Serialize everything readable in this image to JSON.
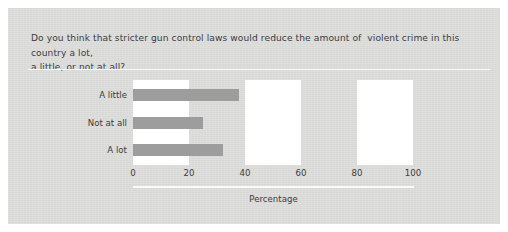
{
  "figure": {
    "background_color": "#dededd",
    "question": "Do you think that stricter gun control laws would reduce the amount of  violent crime in this country a lot,\na little, or not at all?"
  },
  "chart_data": {
    "type": "bar",
    "orientation": "horizontal",
    "title": "",
    "categories": [
      "A little",
      "Not at all",
      "A lot"
    ],
    "values": [
      38,
      25,
      32
    ],
    "xlabel": "Percentage",
    "ylabel": "",
    "xlim": [
      0,
      100
    ],
    "xticks": [
      0,
      20,
      40,
      60,
      80,
      100
    ],
    "xtick_labels": [
      "0",
      "20",
      "40",
      "60",
      "80",
      "100"
    ],
    "grid": false,
    "banding": "alternating white vertical bands at 0-20, 40-60, 80-100",
    "bar_color": "#9d9d9d",
    "band_color": "#ffffff",
    "legend": null
  }
}
